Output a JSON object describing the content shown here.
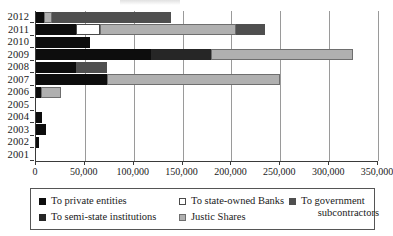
{
  "chart_data": {
    "type": "bar",
    "orientation": "horizontal",
    "stacked": true,
    "title": "",
    "xlabel": "",
    "ylabel": "",
    "xlim": [
      0,
      350000
    ],
    "xticks": [
      0,
      50000,
      100000,
      150000,
      200000,
      250000,
      300000,
      350000
    ],
    "xtick_labels": [
      "0",
      "50,000",
      "100,000",
      "150,000",
      "200,000",
      "250,000",
      "300,000",
      "350,000"
    ],
    "grid": true,
    "grid_axis": "x",
    "legend_position": "bottom",
    "categories": [
      "2012",
      "2011",
      "2010",
      "2009",
      "2008",
      "2007",
      "2006",
      "2005",
      "2004",
      "2003",
      "2002",
      "2001"
    ],
    "series": [
      {
        "name": "To private entities",
        "key": "private",
        "color": "#0d0d0d",
        "values": [
          8000,
          41000,
          55000,
          118000,
          41000,
          73000,
          5000,
          0,
          6000,
          10000,
          3000,
          0
        ]
      },
      {
        "name": "To state-owned Banks",
        "key": "banks",
        "color": "#ffffff",
        "values": [
          0,
          24000,
          0,
          0,
          0,
          0,
          0,
          0,
          0,
          0,
          0,
          0
        ]
      },
      {
        "name": "To government subcontractors",
        "key": "gov",
        "color": "#4f4f4f",
        "values": [
          122000,
          29000,
          0,
          0,
          32000,
          0,
          0,
          0,
          0,
          0,
          0,
          0
        ]
      },
      {
        "name": "To semi-state institutions",
        "key": "semistate",
        "color": "#262626",
        "values": [
          0,
          0,
          0,
          61000,
          0,
          0,
          0,
          0,
          0,
          0,
          0,
          0
        ]
      },
      {
        "name": "Justic Shares",
        "key": "justice",
        "color": "#b0b0b0",
        "values": [
          8000,
          140000,
          0,
          145000,
          0,
          177000,
          21000,
          0,
          0,
          0,
          0,
          0
        ]
      }
    ],
    "stack_order": [
      [
        "private",
        "justice",
        "gov"
      ],
      [
        "private",
        "banks",
        "justice",
        "gov"
      ],
      [
        "private"
      ],
      [
        "private",
        "semistate",
        "justice"
      ],
      [
        "private",
        "gov"
      ],
      [
        "private",
        "justice"
      ],
      [
        "private",
        "justice"
      ],
      [],
      [
        "private"
      ],
      [
        "private"
      ],
      [
        "private"
      ],
      []
    ],
    "totals": [
      138000,
      234000,
      55000,
      324000,
      73000,
      250000,
      26000,
      0,
      6000,
      10000,
      3000,
      0
    ]
  },
  "legend": {
    "items": [
      {
        "label": "To private entities",
        "key": "private"
      },
      {
        "label": "To state-owned Banks",
        "key": "banks"
      },
      {
        "label": "To government",
        "key": "gov",
        "label2": "subcontractors"
      },
      {
        "label": "To semi-state institutions",
        "key": "semistate"
      },
      {
        "label": "Justic Shares",
        "key": "justice"
      }
    ]
  }
}
